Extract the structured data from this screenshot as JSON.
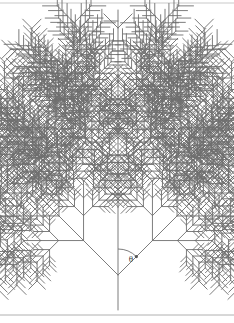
{
  "figure": {
    "type": "fractal-tree-diagram",
    "width": 234,
    "height": 323,
    "background_color": "#ffffff",
    "stroke_color": "#6e6e6e",
    "stroke_width": 0.9
  },
  "frame": {
    "top_rule_color": "#c9c9c9",
    "bottom_rule_color": "#b0b0b0",
    "top_rule_y": 3,
    "bottom_rule_y": 315
  },
  "labels": {
    "angle_symbol": "θ"
  },
  "annotation": {
    "angle_arc": {
      "name": "theta-angle-arc",
      "center_x": 118,
      "center_y": 275,
      "radius": 26,
      "from_angle_deg": 270,
      "to_angle_deg": 315,
      "label_x": 131,
      "label_y": 262,
      "font_size": 9
    }
  },
  "chart_data": {
    "type": "diagram",
    "trunk": {
      "x": 118,
      "y_top": 10,
      "y_bottom": 310
    },
    "branch_angle_deg": 45,
    "recursion_depth": 4,
    "length_ratio": 0.62,
    "primary_nodes": [
      {
        "y": 105,
        "branch_length": 62,
        "depth": 3
      },
      {
        "y": 190,
        "branch_length": 88,
        "depth": 4
      },
      {
        "y": 275,
        "branch_length": 116,
        "depth": 4
      }
    ],
    "apex_tip_length": 20,
    "child_positions": [
      0.42,
      0.72,
      1.0
    ]
  }
}
